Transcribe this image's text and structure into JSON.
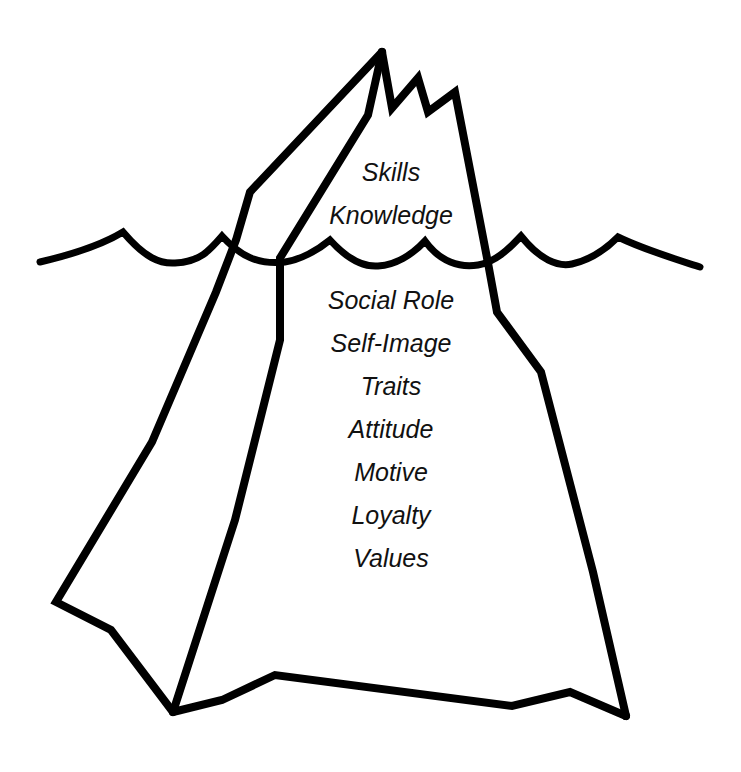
{
  "diagram": {
    "type": "iceberg",
    "colors": {
      "stroke": "#000000",
      "background": "#ffffff",
      "text": "#111111"
    },
    "above_water": {
      "labels": [
        "Skills",
        "Knowledge"
      ]
    },
    "below_water": {
      "labels": [
        "Social Role",
        "Self-Image",
        "Traits",
        "Attitude",
        "Motive",
        "Loyalty",
        "Values"
      ]
    }
  }
}
